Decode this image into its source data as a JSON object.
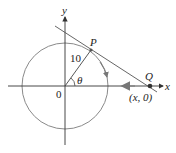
{
  "diagram": {
    "type": "geometry",
    "labels": {
      "y_axis": "y",
      "x_axis": "x",
      "origin": "0",
      "point_p": "P",
      "point_q": "Q",
      "radius": "10",
      "angle": "θ",
      "q_coords": "(x, 0)"
    },
    "colors": {
      "circle": "#8a8a8a",
      "axes": "#333333",
      "radius_line": "#444444",
      "tangent_line": "#555555",
      "arrow": "#777777",
      "point": "#333333"
    }
  }
}
